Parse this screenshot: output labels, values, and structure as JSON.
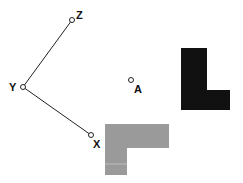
{
  "diagram": {
    "points": [
      {
        "id": "Z",
        "label": "Z",
        "x": 72,
        "y": 20,
        "label_x": 76,
        "label_y": 19
      },
      {
        "id": "Y",
        "label": "Y",
        "x": 23,
        "y": 87,
        "label_x": 9,
        "label_y": 91
      },
      {
        "id": "X",
        "label": "X",
        "x": 91,
        "y": 135,
        "label_x": 93,
        "label_y": 148
      },
      {
        "id": "A",
        "label": "A",
        "x": 131,
        "y": 80,
        "label_x": 134,
        "label_y": 93
      }
    ],
    "segments": [
      {
        "from": "Y",
        "to": "Z"
      },
      {
        "from": "Y",
        "to": "X"
      }
    ],
    "shapes": [
      {
        "id": "black-L",
        "name": "original figure",
        "color": "#111111",
        "points": "181,48 207,48 207,90 230,90 230,110 181,110"
      },
      {
        "id": "gray-L",
        "name": "image figure",
        "color": "#9a9a9a",
        "points": "105,124 169,124 169,148 127,148 127,175 105,175"
      }
    ],
    "colors": {
      "line": "#222222",
      "point_fill": "#ffffff",
      "point_stroke": "#222222"
    }
  }
}
